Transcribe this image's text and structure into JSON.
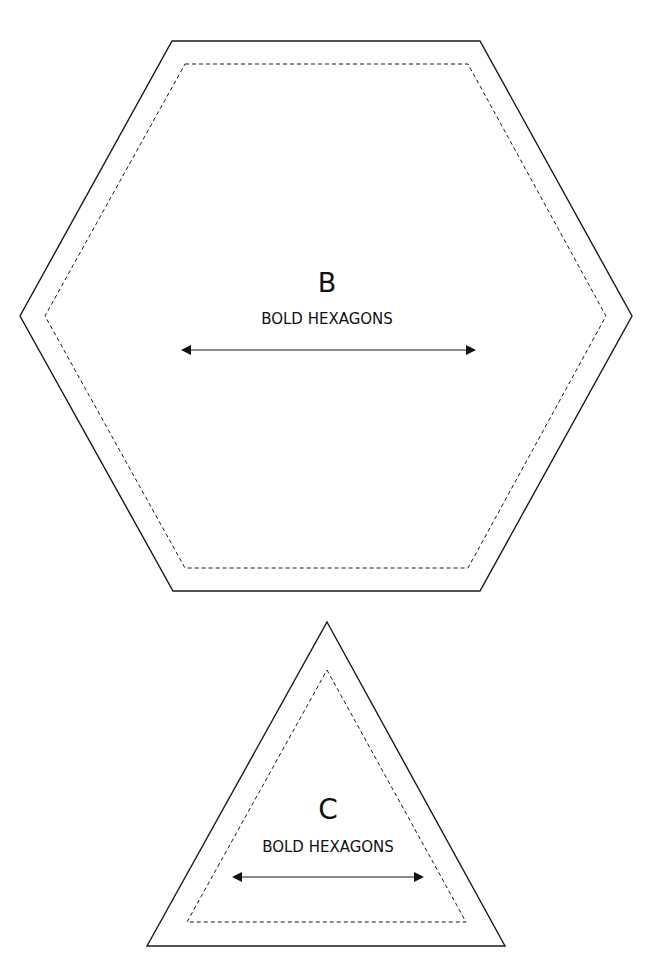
{
  "templates": [
    {
      "id": "B",
      "shape": "hexagon",
      "letter": "B",
      "label": "BOLD HEXAGONS",
      "outer_points": "172,41 480,41 632,316 480,591 173,591 20,316",
      "inner_points": "185,64 468,64 606,316 468,568 185,568 45,316",
      "letter_pos": {
        "x": 327,
        "y": 292
      },
      "label_pos": {
        "x": 327,
        "y": 324
      },
      "grain_arrow": {
        "x1": 181,
        "x2": 476,
        "y": 350
      }
    },
    {
      "id": "C",
      "shape": "triangle",
      "letter": "C",
      "label": "BOLD HEXAGONS",
      "outer_points": "327,622 505,946 147,946",
      "inner_points": "327,670 466,922 187,922",
      "letter_pos": {
        "x": 328,
        "y": 819
      },
      "label_pos": {
        "x": 328,
        "y": 852
      },
      "grain_arrow": {
        "x1": 232,
        "x2": 424,
        "y": 877
      }
    }
  ],
  "legend": {
    "solid_line": "cut-line",
    "dashed_line": "seam-line",
    "arrow": "grain-line"
  }
}
